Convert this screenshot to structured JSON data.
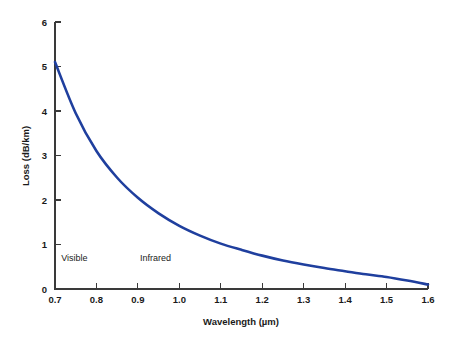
{
  "chart_data": {
    "type": "line",
    "title": "",
    "xlabel": "Wavelength (µm)",
    "ylabel": "Loss (dB/km)",
    "xlim": [
      0.7,
      1.6
    ],
    "ylim": [
      0,
      6
    ],
    "grid": false,
    "legend": "none",
    "line_color": "#1f3f9e",
    "axis_color": "#3a3a3a",
    "background": "#ffffff",
    "xticks": [
      0.7,
      0.8,
      0.9,
      1.0,
      1.1,
      1.2,
      1.3,
      1.4,
      1.5,
      1.6
    ],
    "xticklabels": [
      "0.7",
      "0.8",
      "0.9",
      "1.0",
      "1.1",
      "1.2",
      "1.3",
      "1.4",
      "1.5",
      "1.6"
    ],
    "yticks": [
      0,
      1,
      2,
      3,
      4,
      5,
      6
    ],
    "yticklabels": [
      "0",
      "1",
      "2",
      "3",
      "4",
      "5",
      "6"
    ],
    "series": [
      {
        "name": "Attenuation",
        "color": "#1f3f9e",
        "x": [
          0.7,
          0.75,
          0.8,
          0.85,
          0.9,
          0.95,
          1.0,
          1.05,
          1.1,
          1.15,
          1.2,
          1.25,
          1.3,
          1.35,
          1.4,
          1.45,
          1.5,
          1.55,
          1.6
        ],
        "y": [
          5.1,
          3.95,
          3.1,
          2.5,
          2.05,
          1.7,
          1.42,
          1.2,
          1.02,
          0.88,
          0.75,
          0.64,
          0.55,
          0.47,
          0.4,
          0.33,
          0.27,
          0.19,
          0.1
        ]
      }
    ],
    "annotations": [
      {
        "text": "Visible",
        "x": 0.715,
        "y": 0.62
      },
      {
        "text": "Infrared",
        "x": 0.905,
        "y": 0.62
      }
    ]
  }
}
